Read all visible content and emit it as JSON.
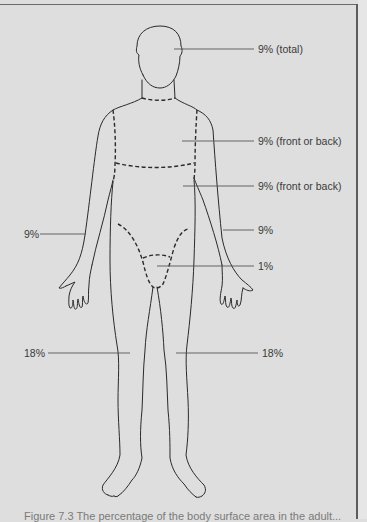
{
  "figure": {
    "labels": {
      "head": "9% (total)",
      "chest": "9% (front or back)",
      "abdomen": "9% (front or back)",
      "left_arm": "9%",
      "right_arm": "9%",
      "genitals": "1%",
      "left_leg": "18%",
      "right_leg": "18%"
    },
    "caption_partial": "Figure 7.3  The percentage of the body surface area in the adult..."
  },
  "colors": {
    "background": "#dedede",
    "line": "#2a2a2a",
    "label_text": "#3a3a3a",
    "leader_line": "#555555"
  }
}
